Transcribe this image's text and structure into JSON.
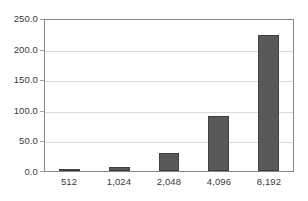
{
  "chart_data": {
    "type": "bar",
    "title": "",
    "xlabel": "",
    "ylabel": "",
    "categories": [
      "512",
      "1,024",
      "2,048",
      "4,096",
      "8,192"
    ],
    "values": [
      2.5,
      7.0,
      29.0,
      91.0,
      226.0
    ],
    "ylim": [
      0,
      250
    ],
    "ytick_values": [
      0,
      50,
      100,
      150,
      200,
      250
    ],
    "ytick_labels": [
      "0.0",
      "50.0",
      "100.0",
      "150.0",
      "200.0",
      "250.0"
    ],
    "grid": true,
    "grid_axis": "y",
    "legend": false,
    "legend_position": "none",
    "bar_color": "#595959",
    "bar_border_color": "#3f3f3f",
    "gridline_color": "#d9d9d9",
    "axis_border_color": "#868686",
    "tick_label_color": "#3a3a3a",
    "background_color": "#ffffff"
  }
}
